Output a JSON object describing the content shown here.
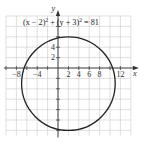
{
  "chart_data": {
    "type": "line",
    "equation": {
      "text_parts": [
        "(x − 2)",
        "2",
        " + (y + 3)",
        "2",
        " = 81"
      ]
    },
    "xlabel": "x",
    "ylabel": "y",
    "xlim": [
      -10,
      14
    ],
    "ylim": [
      -13,
      10
    ],
    "grid": true,
    "grid_step": 2,
    "x_ticks": [
      -8,
      -4,
      2,
      4,
      6,
      8,
      12
    ],
    "x_tick_labels": [
      "−8",
      "−4",
      "2",
      "4",
      "6",
      "8",
      "12"
    ],
    "y_ticks": [
      2,
      4
    ],
    "y_tick_labels": [
      "2",
      "4"
    ],
    "y_minor_ticks": [
      -12,
      -10,
      -8,
      -6,
      -4,
      -2,
      6,
      8
    ],
    "x_minor_ticks": [
      -10,
      -6,
      -2,
      10
    ],
    "series": [
      {
        "name": "circle",
        "shape": "circle",
        "center": [
          2,
          -3
        ],
        "radius": 9,
        "color": "#222222"
      }
    ]
  }
}
